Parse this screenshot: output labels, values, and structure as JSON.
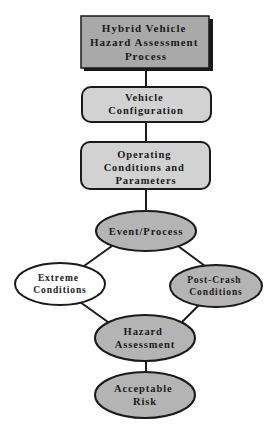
{
  "diagram": {
    "title": "Hybrid Vehicle Hazard Assessment Process",
    "colors": {
      "title_fill": "#a9a9a9",
      "box_fill": "#d2d2d2",
      "ellipse_fill": "#b4b4b4",
      "white_fill": "#ffffff",
      "stroke": "#1a1a1a"
    },
    "nodes": {
      "title_box": {
        "lines": [
          "Hybrid Vehicle",
          "Hazard Assessment",
          "Process"
        ]
      },
      "vehicle_configuration": {
        "lines": [
          "Vehicle",
          "Configuration"
        ]
      },
      "operating_conditions": {
        "lines": [
          "Operating",
          "Conditions and",
          "Parameters"
        ]
      },
      "event_process": {
        "lines": [
          "Event/Process"
        ]
      },
      "extreme_conditions": {
        "lines": [
          "Extreme",
          "Conditions"
        ]
      },
      "post_crash_conditions": {
        "lines": [
          "Post-Crash",
          "Conditions"
        ]
      },
      "hazard_assessment": {
        "lines": [
          "Hazard",
          "Assessment"
        ]
      },
      "acceptable_risk": {
        "lines": [
          "Acceptable",
          "Risk"
        ]
      }
    },
    "edges": [
      {
        "from": "title_box",
        "to": "vehicle_configuration"
      },
      {
        "from": "vehicle_configuration",
        "to": "operating_conditions"
      },
      {
        "from": "operating_conditions",
        "to": "event_process"
      },
      {
        "from": "event_process",
        "to": "extreme_conditions"
      },
      {
        "from": "event_process",
        "to": "post_crash_conditions"
      },
      {
        "from": "extreme_conditions",
        "to": "hazard_assessment"
      },
      {
        "from": "post_crash_conditions",
        "to": "hazard_assessment"
      },
      {
        "from": "hazard_assessment",
        "to": "acceptable_risk"
      }
    ]
  }
}
